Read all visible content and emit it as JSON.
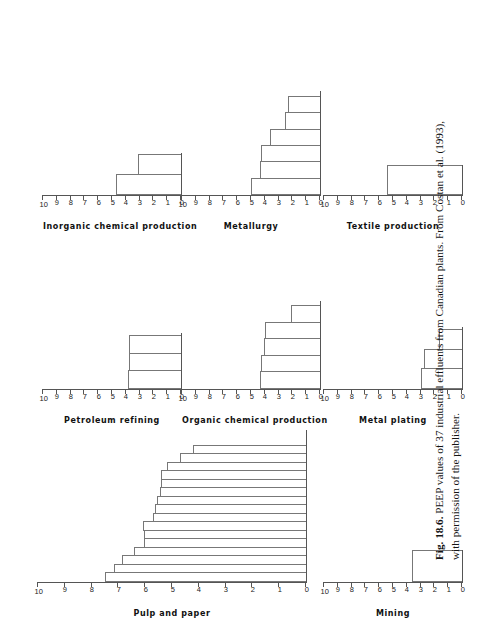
{
  "figure": {
    "label": "Fig. 18.6.",
    "caption_line1": "PEEP values of 37 industrial effluents from Canadian plants. From Costan et al. (1993),",
    "caption_line2": "with permission of the publisher."
  },
  "axis": {
    "ticks": [
      "0",
      "1",
      "2",
      "3",
      "4",
      "5",
      "6",
      "7",
      "8",
      "9",
      "10"
    ],
    "min": 0,
    "max": 10
  },
  "chart_data": [
    {
      "type": "bar",
      "title": "Pulp and paper",
      "ylabel": "PEEP value",
      "ylim": [
        0,
        10
      ],
      "categories": [
        "1",
        "2",
        "3",
        "4",
        "5",
        "6",
        "7",
        "8",
        "9",
        "10",
        "11",
        "12",
        "13",
        "14",
        "15",
        "16"
      ],
      "values": [
        7.5,
        7.15,
        6.85,
        6.4,
        6.05,
        6.05,
        6.1,
        5.7,
        5.65,
        5.55,
        5.45,
        5.4,
        5.4,
        5.2,
        4.7,
        4.2
      ],
      "n": 16
    },
    {
      "type": "bar",
      "title": "Inorganic chemical production",
      "ylabel": "PEEP value",
      "ylim": [
        0,
        10
      ],
      "categories": [
        "1",
        "2"
      ],
      "values": [
        4.7,
        3.15
      ],
      "n": 2
    },
    {
      "type": "bar",
      "title": "Metallurgy",
      "ylabel": "PEEP value",
      "ylim": [
        0,
        10
      ],
      "categories": [
        "1",
        "2",
        "3",
        "4",
        "5",
        "6"
      ],
      "values": [
        5.0,
        4.35,
        4.25,
        3.6,
        2.55,
        2.35
      ],
      "n": 6
    },
    {
      "type": "bar",
      "title": "Textile production",
      "ylabel": "PEEP value",
      "ylim": [
        0,
        10
      ],
      "categories": [
        "1"
      ],
      "values": [
        5.45
      ],
      "n": 1
    },
    {
      "type": "bar",
      "title": "Petroleum refining",
      "ylabel": "PEEP value",
      "ylim": [
        0,
        10
      ],
      "categories": [
        "1",
        "2",
        "3"
      ],
      "values": [
        3.85,
        3.75,
        3.75
      ],
      "n": 3
    },
    {
      "type": "bar",
      "title": "Organic chemical production",
      "ylabel": "PEEP value",
      "ylim": [
        0,
        10
      ],
      "categories": [
        "1",
        "2",
        "3",
        "4",
        "5"
      ],
      "values": [
        4.35,
        4.25,
        4.05,
        4.0,
        2.1
      ],
      "n": 5
    },
    {
      "type": "bar",
      "title": "Metal plating",
      "ylabel": "PEEP value",
      "ylim": [
        0,
        10
      ],
      "categories": [
        "1",
        "2",
        "3"
      ],
      "values": [
        3.0,
        2.75,
        1.7
      ],
      "n": 3
    },
    {
      "type": "bar",
      "title": "Mining",
      "ylabel": "PEEP value",
      "ylim": [
        0,
        10
      ],
      "categories": [
        "1"
      ],
      "values": [
        3.65
      ],
      "n": 1
    }
  ]
}
